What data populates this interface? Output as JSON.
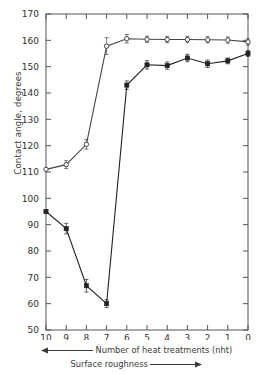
{
  "chart_data": {
    "type": "line",
    "title": "",
    "xlabel": "Number of heat  treatments (nht)",
    "xlabel_secondary": "Surface roughness",
    "ylabel": "Contact angle, degrees",
    "xlim": [
      10,
      0
    ],
    "ylim": [
      50,
      170
    ],
    "x_reversed": true,
    "grid": false,
    "legend": "none",
    "x_ticks": [
      "10",
      "9",
      "8",
      "7",
      "6",
      "5",
      "4",
      "3",
      "2",
      "1",
      "0"
    ],
    "y_ticks": [
      "50",
      "60",
      "70",
      "80",
      "90",
      "100",
      "110",
      "120",
      "130",
      "140",
      "150",
      "160",
      "170"
    ],
    "x": [
      10,
      9,
      8,
      7,
      6,
      5,
      4,
      3,
      2,
      1,
      0
    ],
    "series": [
      {
        "name": "open-circle-series",
        "marker": "open-circle",
        "color": "#444444",
        "values": [
          111.0,
          112.8,
          120.5,
          157.8,
          160.6,
          160.4,
          160.3,
          160.3,
          160.2,
          160.1,
          159.4
        ],
        "errors": [
          0.0,
          1.5,
          1.8,
          3.2,
          1.6,
          1.2,
          1.2,
          1.2,
          1.2,
          1.2,
          1.2
        ]
      },
      {
        "name": "filled-square-series",
        "marker": "filled-square",
        "color": "#222222",
        "values": [
          95.0,
          88.5,
          66.8,
          60.0,
          143.0,
          150.7,
          150.4,
          153.3,
          151.1,
          152.2,
          155.0
        ],
        "errors": [
          0.6,
          2.0,
          2.4,
          1.5,
          1.6,
          1.6,
          1.4,
          1.4,
          1.4,
          1.1,
          1.1
        ]
      }
    ],
    "axis_arrows": {
      "nht_direction": "left",
      "roughness_direction": "right"
    }
  }
}
